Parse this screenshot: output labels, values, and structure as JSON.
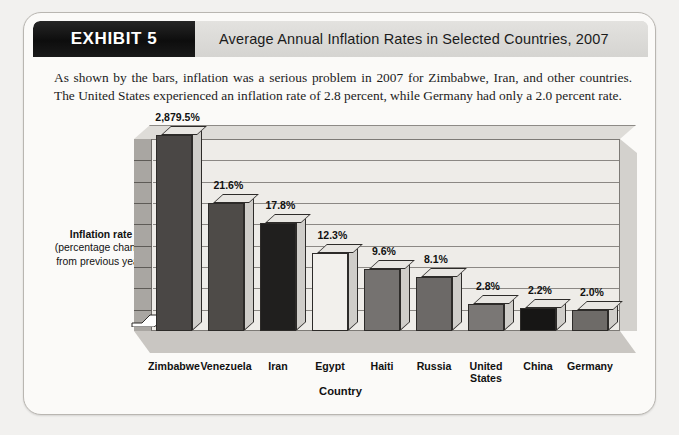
{
  "exhibit": {
    "badge_label": "EXHIBIT 5",
    "title": "Average Annual Inflation Rates in Selected Countries, 2007",
    "caption": "As shown by the bars, inflation was a serious problem in 2007 for Zimbabwe, Iran, and other countries. The United States experienced an inflation rate of 2.8 percent, while Germany had only a 2.0 percent rate."
  },
  "axis": {
    "y_title_strong": "Inflation rate",
    "y_title_rest": "(percentage change from previous year)",
    "x_title": "Country"
  },
  "colors": {
    "badge_bg": "#141414",
    "title_band_bg": "#d9d8d5",
    "card_bg": "#fbfaf8",
    "page_bg": "#f2f1ef",
    "plot_bg": "#eeece8",
    "floor": "#c9c6c2",
    "left_wall": "#a9a6a2",
    "gridline": "#8b8884",
    "bar_outline": "#2d2b29"
  },
  "chart_data": {
    "type": "bar",
    "title": "Average Annual Inflation Rates in Selected Countries, 2007",
    "xlabel": "Country",
    "ylabel": "Inflation rate (percentage change from previous year)",
    "grid": true,
    "legend": "none",
    "note": "Vertical scale is broken; the Zimbabwe bar is truncated.",
    "ylim": [
      0,
      24
    ],
    "gridline_count": 8,
    "categories": [
      "Zimbabwe",
      "Venezuela",
      "Iran",
      "Egypt",
      "Haiti",
      "Russia",
      "United States",
      "China",
      "Germany"
    ],
    "values": [
      2879.5,
      21.6,
      17.8,
      12.3,
      9.6,
      8.1,
      2.8,
      2.2,
      2.0
    ],
    "value_labels": [
      "2,879.5%",
      "21.6%",
      "17.8%",
      "12.3%",
      "9.6%",
      "8.1%",
      "2.8%",
      "2.2%",
      "2.0%"
    ],
    "bar_colors": [
      "#4a4745",
      "#4e4b48",
      "#201f1e",
      "#f2f0ec",
      "#757270",
      "#6c6967",
      "#7a7775",
      "#171615",
      "#6e6b68"
    ],
    "bar_heights_px": [
      196,
      128,
      108,
      78,
      62,
      54,
      27,
      23,
      21
    ]
  }
}
